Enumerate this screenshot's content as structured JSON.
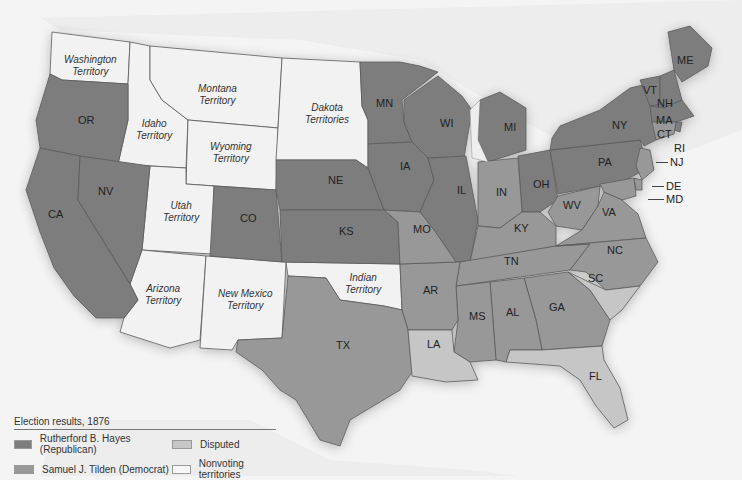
{
  "map": {
    "title": "Election results, 1876",
    "colors": {
      "hayes": "#7d7d7d",
      "tilden": "#989898",
      "disputed": "#c6c6c6",
      "nonvoting": "#f2f2f2",
      "water": "#f4f4f4",
      "border": "#555555"
    },
    "territories": [
      {
        "id": "washington",
        "line1": "Washington",
        "line2": "Territory"
      },
      {
        "id": "montana",
        "line1": "Montana",
        "line2": "Territory"
      },
      {
        "id": "dakota",
        "line1": "Dakota",
        "line2": "Territories"
      },
      {
        "id": "idaho",
        "line1": "Idaho",
        "line2": "Territory"
      },
      {
        "id": "wyoming",
        "line1": "Wyoming",
        "line2": "Territory"
      },
      {
        "id": "utah",
        "line1": "Utah",
        "line2": "Territory"
      },
      {
        "id": "arizona",
        "line1": "Arizona",
        "line2": "Territory"
      },
      {
        "id": "newmexico",
        "line1": "New Mexico",
        "line2": "Territory"
      },
      {
        "id": "indian",
        "line1": "Indian",
        "line2": "Territory"
      }
    ],
    "states": {
      "hayes": [
        "OR",
        "CA",
        "NV",
        "CO",
        "NE",
        "KS",
        "MN",
        "IA",
        "WI",
        "IL",
        "MI",
        "OH",
        "PA",
        "NY",
        "VT",
        "NH",
        "ME",
        "MA",
        "RI"
      ],
      "tilden": [
        "MO",
        "TX",
        "AR",
        "MS",
        "AL",
        "GA",
        "TN",
        "KY",
        "IN",
        "WV",
        "VA",
        "NC",
        "NJ",
        "CT",
        "DE",
        "MD"
      ],
      "disputed": [
        "LA",
        "SC",
        "FL"
      ]
    },
    "labels": {
      "OR": "OR",
      "CA": "CA",
      "NV": "NV",
      "CO": "CO",
      "NE": "NE",
      "KS": "KS",
      "MN": "MN",
      "IA": "IA",
      "WI": "WI",
      "IL": "IL",
      "MI": "MI",
      "IN": "IN",
      "OH": "OH",
      "PA": "PA",
      "NY": "NY",
      "VT": "VT",
      "NH": "NH",
      "ME": "ME",
      "MA": "MA",
      "CT": "CT",
      "RI": "RI",
      "NJ": "NJ",
      "DE": "DE",
      "MD": "MD",
      "WV": "WV",
      "VA": "VA",
      "KY": "KY",
      "TN": "TN",
      "NC": "NC",
      "SC": "SC",
      "GA": "GA",
      "AL": "AL",
      "MS": "MS",
      "AR": "AR",
      "MO": "MO",
      "LA": "LA",
      "TX": "TX",
      "FL": "FL"
    }
  },
  "legend": {
    "title": "Election results, 1876",
    "items": [
      {
        "label": "Rutherford B. Hayes (Republican)",
        "color": "#7d7d7d"
      },
      {
        "label": "Disputed",
        "color": "#c6c6c6"
      },
      {
        "label": "Samuel J. Tilden (Democrat)",
        "color": "#989898"
      },
      {
        "label": "Nonvoting territories",
        "color": "#f7f7f7"
      }
    ]
  }
}
